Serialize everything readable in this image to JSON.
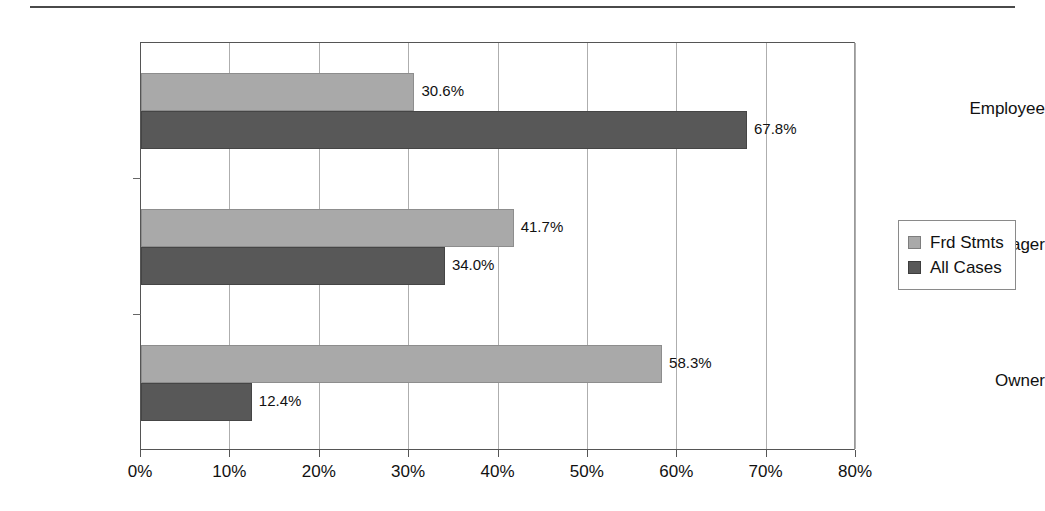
{
  "chart_data": {
    "type": "bar",
    "orientation": "horizontal",
    "title": "",
    "xlabel": "",
    "ylabel": "",
    "xlim": [
      0,
      80
    ],
    "xticks": [
      "0%",
      "10%",
      "20%",
      "30%",
      "40%",
      "50%",
      "60%",
      "70%",
      "80%"
    ],
    "grid": "vertical",
    "legend_position": "right",
    "categories": [
      "Employee",
      "Manager",
      "Owner"
    ],
    "series": [
      {
        "name": "Frd Stmts",
        "color": "#a9a9a9",
        "values": [
          30.6,
          41.7,
          58.3
        ],
        "labels": [
          "30.6%",
          "41.7%",
          "58.3%"
        ]
      },
      {
        "name": "All Cases",
        "color": "#585858",
        "values": [
          67.8,
          34.0,
          12.4
        ],
        "labels": [
          "67.8%",
          "34.0%",
          "12.4%"
        ]
      }
    ]
  },
  "legend": {
    "items": [
      {
        "label": "Frd Stmts",
        "swatch": "light"
      },
      {
        "label": "All Cases",
        "swatch": "dark"
      }
    ]
  }
}
